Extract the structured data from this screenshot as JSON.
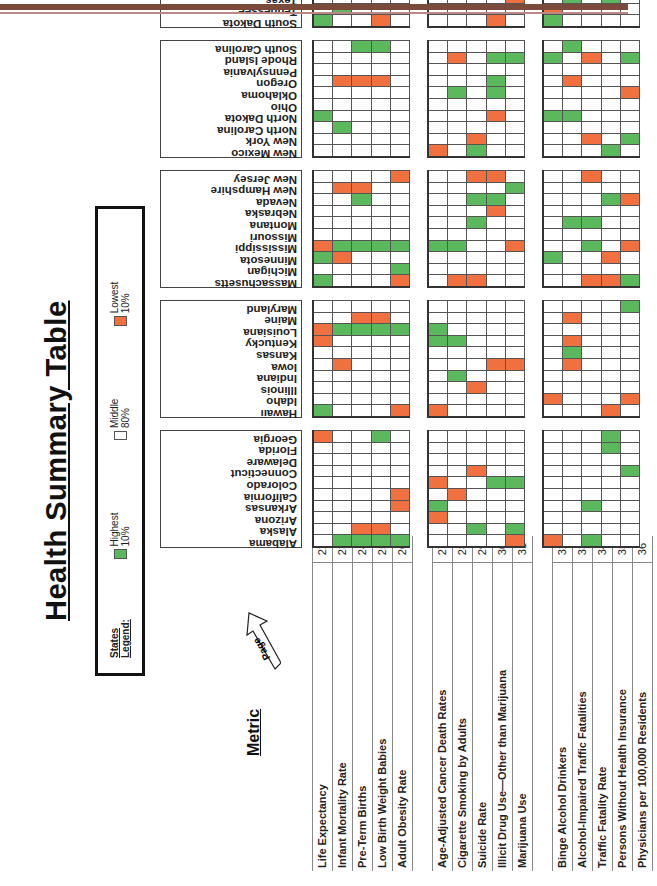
{
  "title": "Health Summary Table",
  "legend": {
    "title": "States Legend:",
    "items": [
      {
        "label": "Highest 10%",
        "color": "#5cb85c",
        "code": "G"
      },
      {
        "label": "Middle 80%",
        "color": "#ffffff",
        "code": "W"
      },
      {
        "label": "Lowest 10%",
        "color": "#f07040",
        "code": "O"
      }
    ]
  },
  "metric_header": "Metric",
  "page_label": "Page",
  "metric_groups": [
    [
      {
        "label": "Life Expectancy",
        "page": "22"
      },
      {
        "label": "Infant Mortality Rate",
        "page": "23"
      },
      {
        "label": "Pre-Term Births",
        "page": "24"
      },
      {
        "label": "Low Birth Weight Babies",
        "page": "25"
      },
      {
        "label": "Adult Obesity Rate",
        "page": "26"
      }
    ],
    [
      {
        "label": "Age-Adjusted Cancer Death Rates",
        "page": "27"
      },
      {
        "label": "Cigarette Smoking by Adults",
        "page": "28"
      },
      {
        "label": "Suicide Rate",
        "page": "29"
      },
      {
        "label": "Illicit Drug Use—Other than Marijuana",
        "page": "30"
      },
      {
        "label": "Marijuana Use",
        "page": "31"
      }
    ],
    [
      {
        "label": "Binge Alcohol Drinkers",
        "page": "32"
      },
      {
        "label": "Alcohol-Impaired Traffic Fatalities",
        "page": "33"
      },
      {
        "label": "Traffic Fatality Rate",
        "page": "34"
      },
      {
        "label": "Persons Without Health Insurance",
        "page": "35"
      },
      {
        "label": "Physicians per 100,000 Residents",
        "page": "36"
      }
    ]
  ],
  "state_groups": [
    [
      "Alabama",
      "Alaska",
      "Arizona",
      "Arkansas",
      "California",
      "Colorado",
      "Connecticut",
      "Delaware",
      "Florida",
      "Georgia"
    ],
    [
      "Hawaii",
      "Idaho",
      "Illinois",
      "Indiana",
      "Iowa",
      "Kansas",
      "Kentucky",
      "Louisiana",
      "Maine",
      "Maryland"
    ],
    [
      "Massachusetts",
      "Michigan",
      "Minnesota",
      "Mississippi",
      "Missouri",
      "Montana",
      "Nebraska",
      "Nevada",
      "New Hampshire",
      "New Jersey"
    ],
    [
      "New Mexico",
      "New York",
      "North Carolina",
      "North Dakota",
      "Ohio",
      "Oklahoma",
      "Oregon",
      "Pennsylvania",
      "Rhode Island",
      "South Carolina"
    ],
    [
      "South Dakota",
      "Tennessee",
      "Texas",
      "Utah",
      "Vermont",
      "Virginia",
      "Washington",
      "West Virginia",
      "Wisconsin",
      "Wyoming"
    ]
  ],
  "ratings_note": "ratings[metricGroup][stateGroup][stateIndex] = 5-char string for the 5 metrics in that group; G=Highest 10%, W=Middle 80%, O=Lowest 10%",
  "ratings": [
    [
      [
        "WGGGG",
        "WWOOW",
        "WWWWW",
        "WWWWO",
        "WWWWO",
        "WWWWW",
        "WWWWW",
        "WWWWW",
        "WWWWW",
        "OWWGW"
      ],
      [
        "GWWWO",
        "WWWWW",
        "WWWWW",
        "WWWWW",
        "WOWWW",
        "WWWWW",
        "OWWWW",
        "OGGGG",
        "WWOOW",
        "WWWWW"
      ],
      [
        "GWWWO",
        "WWWWG",
        "GOWWW",
        "OGGGG",
        "WWWWW",
        "WWWWW",
        "WWWWW",
        "WWGWW",
        "WOOWW",
        "WWWWO"
      ],
      [
        "WWWWW",
        "WWWWW",
        "WGWWW",
        "GWWWW",
        "WWWWW",
        "WWWWW",
        "WOOOW",
        "WWWWW",
        "WWWWW",
        "WWGGW"
      ],
      [
        "GWWOW",
        "WGWWW",
        "WWWWW",
        "WWWWW",
        "WWWWW",
        "WWOWW",
        "WWWWW",
        "OWWWG",
        "WWWWW",
        "WWWWW"
      ]
    ],
    [
      [
        "WWWWO",
        "WWGWG",
        "OWWWW",
        "GWWWW",
        "WOWWW",
        "OWWGG",
        "WWOWW",
        "WWWWW",
        "WWWWW",
        "WWWWW"
      ],
      [
        "OWWWW",
        "WWWWW",
        "WWOWW",
        "WGWWW",
        "WWWOO",
        "WWWWW",
        "GGWWW",
        "GWWWW",
        "WWWWW",
        "WWWWW"
      ],
      [
        "WOOWW",
        "WWWWW",
        "WWWWW",
        "GGWWO",
        "WWWWW",
        "WWGWW",
        "WWWOW",
        "WWGGW",
        "WWWWG",
        "WWOOW"
      ],
      [
        "OWGWW",
        "WWOWW",
        "WWWWW",
        "WWWOW",
        "WWWWW",
        "WGWGW",
        "WWWGW",
        "WWWWW",
        "WOWGG",
        "WWWWW"
      ],
      [
        "WWWOW",
        "WWWWW",
        "WWWWO",
        "OOWWO",
        "WWWWG",
        "WWWWW",
        "WOWWW",
        "GGWWW",
        "WWWWW",
        "WWGWW"
      ]
    ],
    [
      [
        "OWGWW",
        "WWWWW",
        "WWWWW",
        "WWGWW",
        "WWWWW",
        "WWWWW",
        "WWWWG",
        "WWWWW",
        "WWWGW",
        "WWWGW"
      ],
      [
        "WWWOW",
        "OWWWO",
        "WWWWW",
        "WWWWW",
        "WOWWW",
        "WGWWW",
        "WOWWW",
        "WWWWW",
        "WOWWW",
        "WWWWG"
      ],
      [
        "WWOOG",
        "WWWWW",
        "GWWOW",
        "WWGWO",
        "WWWWW",
        "WGGWW",
        "WWWWW",
        "WWWGO",
        "WWWWW",
        "WWOWW"
      ],
      [
        "WWWGW",
        "WWOWG",
        "WWWWW",
        "GGWWW",
        "WWWWW",
        "WWWWO",
        "WOWWW",
        "WWWWW",
        "GWOWG",
        "WGWWW"
      ],
      [
        "GWWWW",
        "OWWWW",
        "WGWGW",
        "OOWWW",
        "WWWOW",
        "WWWWW",
        "WWOWW",
        "OWWWW",
        "GWWOW",
        "WWGWO"
      ]
    ]
  ]
}
